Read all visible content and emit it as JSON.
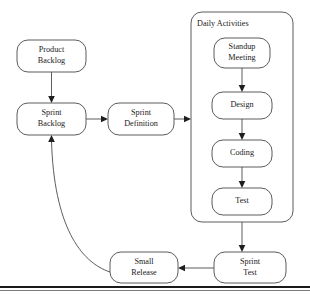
{
  "diagram": {
    "style": {
      "node_fill": "#ffffff",
      "node_stroke": "#4a4a4a",
      "arrow_color": "#1f1f1f",
      "text_color": "#1a1a1a",
      "background": "#ffffff",
      "rule_color": "#1a1a1a"
    },
    "group": {
      "label": "Daily Activities",
      "x": 191,
      "y": 12,
      "width": 102,
      "height": 210,
      "radius": 11,
      "label_x": 197,
      "label_y": 24
    },
    "nodes": [
      {
        "id": "product-backlog",
        "label_line1": "Product",
        "label_line2": "Backlog",
        "x": 17,
        "y": 40,
        "width": 69,
        "height": 32,
        "radius": 11
      },
      {
        "id": "sprint-backlog",
        "label_line1": "Sprint",
        "label_line2": "Backlog",
        "x": 17,
        "y": 103,
        "width": 69,
        "height": 32,
        "radius": 11
      },
      {
        "id": "sprint-definition",
        "label_line1": "Sprint",
        "label_line2": "Definition",
        "x": 108,
        "y": 103,
        "width": 66,
        "height": 32,
        "radius": 11
      },
      {
        "id": "standup-meeting",
        "label_line1": "Standup",
        "label_line2": "Meeting",
        "x": 214,
        "y": 38,
        "width": 56,
        "height": 30,
        "radius": 11
      },
      {
        "id": "design",
        "label_line1": "Design",
        "label_line2": "",
        "x": 212,
        "y": 92,
        "width": 60,
        "height": 27,
        "radius": 11
      },
      {
        "id": "coding",
        "label_line1": "Coding",
        "label_line2": "",
        "x": 212,
        "y": 140,
        "width": 60,
        "height": 27,
        "radius": 11
      },
      {
        "id": "test",
        "label_line1": "Test",
        "label_line2": "",
        "x": 212,
        "y": 188,
        "width": 60,
        "height": 27,
        "radius": 11
      },
      {
        "id": "sprint-test",
        "label_line1": "Sprint",
        "label_line2": "Test",
        "x": 214,
        "y": 252,
        "width": 72,
        "height": 31,
        "radius": 11
      },
      {
        "id": "small-release",
        "label_line1": "Small",
        "label_line2": "Release",
        "x": 110,
        "y": 252,
        "width": 68,
        "height": 31,
        "radius": 11
      }
    ],
    "edges": [
      {
        "id": "product-backlog-to-sprint-backlog",
        "from": "product-backlog",
        "to": "sprint-backlog",
        "type": "line",
        "path": "M 51.5 72 L 51.5 98",
        "arrow": "M 51.5 103 L 48.2 96 L 54.8 96 Z"
      },
      {
        "id": "sprint-backlog-to-sprint-definition",
        "from": "sprint-backlog",
        "to": "sprint-definition",
        "type": "line",
        "path": "M 86 119 L 103 119",
        "arrow": "M 108 119 L 101 115.7 L 101 122.3 Z"
      },
      {
        "id": "sprint-definition-to-daily-activities",
        "from": "sprint-definition",
        "to": "group",
        "type": "line",
        "path": "M 174 119 L 186 119",
        "arrow": "M 191 119 L 184 115.7 L 184 122.3 Z"
      },
      {
        "id": "standup-to-design",
        "from": "standup-meeting",
        "to": "design",
        "type": "line",
        "path": "M 242 68 L 242 87",
        "arrow": "M 242 92 L 238.7 85 L 245.3 85 Z"
      },
      {
        "id": "design-to-coding",
        "from": "design",
        "to": "coding",
        "type": "line",
        "path": "M 242 119 L 242 135",
        "arrow": "M 242 140 L 238.7 133 L 245.3 133 Z"
      },
      {
        "id": "coding-to-test",
        "from": "coding",
        "to": "test",
        "type": "line",
        "path": "M 242 167 L 242 183",
        "arrow": "M 242 188 L 238.7 181 L 245.3 181 Z"
      },
      {
        "id": "daily-activities-to-sprint-test",
        "from": "group",
        "to": "sprint-test",
        "type": "line",
        "path": "M 242 222 L 242 247",
        "arrow": "M 242 252 L 238.7 245 L 245.3 245 Z"
      },
      {
        "id": "sprint-test-to-small-release",
        "from": "sprint-test",
        "to": "small-release",
        "type": "line",
        "path": "M 214 268 L 183 268",
        "arrow": "M 178 268 L 185 264.7 L 185 271.3 Z"
      },
      {
        "id": "small-release-to-sprint-backlog",
        "from": "small-release",
        "to": "sprint-backlog",
        "type": "curve",
        "path": "M 110 272 C 80 262 54 225 51.5 141",
        "arrow": "M 51.5 135 L 48.2 142 L 54.8 142 Z"
      }
    ],
    "bottom_rule": {
      "thick_y": 286,
      "thin_y": 290
    }
  }
}
